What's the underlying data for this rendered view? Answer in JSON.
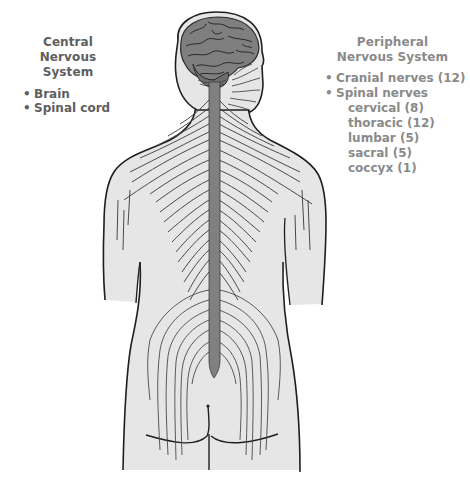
{
  "diagram": {
    "colors": {
      "skin_fill": "#e6e6e6",
      "outline": "#1f1f1f",
      "nerve_lines": "#4a4a4a",
      "brain_fill": "#7f7f7f",
      "spinal_cord_fill": "#808080",
      "cns_text": "#5e5e5e",
      "pns_text": "#8a8a8a"
    }
  },
  "central": {
    "title_line1": "Central",
    "title_line2": "Nervous System",
    "bullet": "•",
    "items": [
      {
        "label": "Brain"
      },
      {
        "label": "Spinal cord"
      }
    ]
  },
  "peripheral": {
    "title_line1": "Peripheral",
    "title_line2": "Nervous System",
    "bullet": "•",
    "items": [
      {
        "label": "Cranial nerves (12)"
      },
      {
        "label": "Spinal nerves"
      }
    ],
    "spinal_subitems": [
      {
        "label": "cervical (8)"
      },
      {
        "label": "thoracic (12)"
      },
      {
        "label": "lumbar (5)"
      },
      {
        "label": "sacral (5)"
      },
      {
        "label": "coccyx (1)"
      }
    ]
  }
}
